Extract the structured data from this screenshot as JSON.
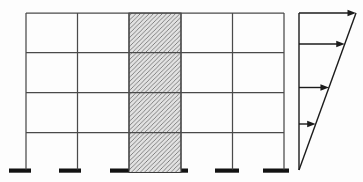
{
  "figure": {
    "colors": {
      "background": "#fdfdfd",
      "frame_line": "#4a4a4a",
      "wall_edge": "#3c3c3c",
      "wall_fill": "#e2e2e2",
      "hatch_line": "#6f6f6f",
      "footing": "#121212",
      "load_line": "#1c1c1c"
    },
    "frame": {
      "stories": 4,
      "bays": 5,
      "column_x": [
        26,
        77.5,
        129,
        181,
        232.5,
        284
      ],
      "beam_y": [
        13,
        52.5,
        92.5,
        132.5
      ],
      "base_y": 168.5,
      "shear_wall": {
        "x": 129,
        "width": 52,
        "top": 13,
        "bottom": 172.5,
        "hatch_direction": "forward-diagonal",
        "hatch_spacing": 4.4
      },
      "footings": [
        {
          "x": 9,
          "width": 22
        },
        {
          "x": 59,
          "width": 22
        },
        {
          "x": 110,
          "width": 78
        },
        {
          "x": 215,
          "width": 24
        },
        {
          "x": 263,
          "width": 26
        }
      ],
      "footing_thickness": 4.2
    },
    "load_diagram": {
      "profile": "inverted-triangle",
      "arrow_direction": "right",
      "arrow_count": 4,
      "axis_x": 299,
      "top_y": 13,
      "base_y": 170,
      "max_extent_x": 356,
      "arrow_y": [
        13,
        44,
        87.5,
        124
      ]
    }
  }
}
